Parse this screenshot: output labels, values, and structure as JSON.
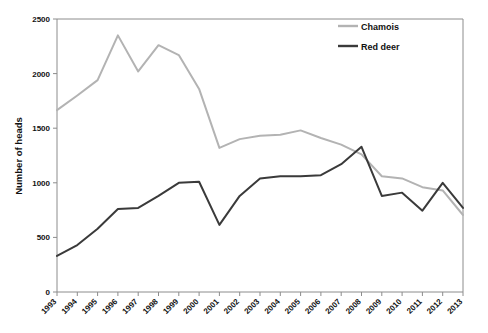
{
  "chart_data": {
    "type": "line",
    "title": "",
    "subtitle": "",
    "xlabel": "",
    "ylabel": "Number of heads",
    "xlim": [
      1993,
      2013
    ],
    "ylim": [
      0,
      2500
    ],
    "yticks": [
      0,
      500,
      1000,
      1500,
      2000,
      2500
    ],
    "ytick_labels": [
      "0",
      "500",
      "1000",
      "1500",
      "2000",
      "2500"
    ],
    "grid": false,
    "legend_position": "top-right",
    "categories": [
      "1993",
      "1994",
      "1995",
      "1996",
      "1997",
      "1998",
      "1999",
      "2000",
      "2001",
      "2002",
      "2003",
      "2004",
      "2005",
      "2006",
      "2007",
      "2008",
      "2009",
      "2010",
      "2011",
      "2012",
      "2013"
    ],
    "x": [
      1993,
      1994,
      1995,
      1996,
      1997,
      1998,
      1999,
      2000,
      2001,
      2002,
      2003,
      2004,
      2005,
      2006,
      2007,
      2008,
      2009,
      2010,
      2011,
      2012,
      2013
    ],
    "series": [
      {
        "name": "Chamois",
        "color": "#b3b3b3",
        "values": [
          1665,
          1800,
          1940,
          2350,
          2020,
          2260,
          2170,
          1860,
          1320,
          1400,
          1430,
          1440,
          1480,
          1410,
          1350,
          1260,
          1060,
          1040,
          960,
          930,
          705
        ]
      },
      {
        "name": "Red deer",
        "color": "#3a3a3a",
        "values": [
          330,
          430,
          580,
          760,
          770,
          880,
          1000,
          1010,
          615,
          880,
          1040,
          1060,
          1060,
          1070,
          1170,
          1330,
          880,
          910,
          745,
          1000,
          770
        ]
      }
    ],
    "legend": [
      {
        "label": "Chamois",
        "color": "#b3b3b3"
      },
      {
        "label": "Red deer",
        "color": "#3a3a3a"
      }
    ]
  },
  "axes": {
    "ylabel": "Number of heads"
  }
}
